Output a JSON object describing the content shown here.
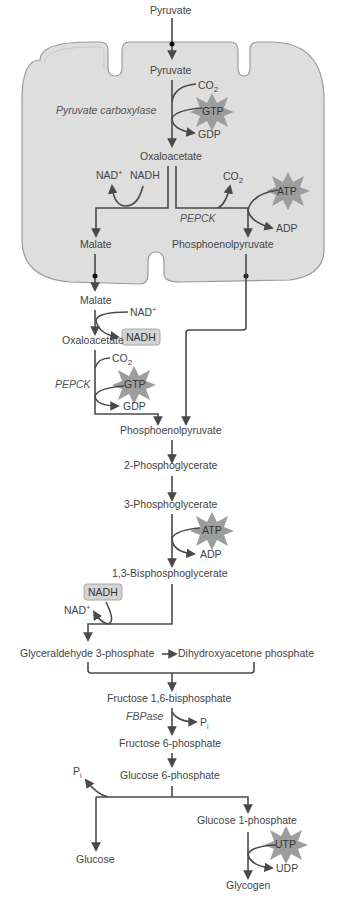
{
  "diagram": {
    "colors": {
      "mitochondrion_fill": "#dedede",
      "membrane_stroke": "#9a9a9a",
      "arrow": "#4a4a4a",
      "starburst": "#9d9d9d",
      "nadh_box": "#d4d4d4",
      "text": "#444444"
    },
    "mitochondrion": {
      "pyruvate_outside": "Pyruvate",
      "pyruvate_inside": "Pyruvate",
      "co2_1": "CO",
      "co2_1_sub": "2",
      "gtp_1": "GTP",
      "gdp_1": "GDP",
      "enzyme_pc": "Pyruvate carboxylase",
      "oxaloacetate": "Oxaloacetate",
      "nad_plus": "NAD",
      "nad_plus_sup": "+",
      "nadh": "NADH",
      "co2_2": "CO",
      "co2_2_sub": "2",
      "atp_1": "ATP",
      "adp_1": "ADP",
      "enzyme_pepck": "PEPCK",
      "malate": "Malate",
      "pep": "Phosphoenolpyruvate"
    },
    "cytosol": {
      "malate": "Malate",
      "nad_plus": "NAD",
      "nad_plus_sup": "+",
      "nadh_box": "NADH",
      "oxaloacetate": "Oxaloacetate",
      "co2": "CO",
      "co2_sub": "2",
      "enzyme_pepck": "PEPCK",
      "gtp": "GTP",
      "gdp": "GDP",
      "pep": "Phosphoenolpyruvate",
      "pg2": "2-Phosphoglycerate",
      "pg3": "3-Phosphoglycerate",
      "atp": "ATP",
      "adp": "ADP",
      "bpg": "1,3-Bisphosphoglycerate",
      "nadh_box2": "NADH",
      "nad_plus2": "NAD",
      "nad_plus2_sup": "+",
      "g3p": "Glyceraldehyde 3-phosphate",
      "dhap": "Dihydroxyacetone phosphate",
      "f16bp": "Fructose 1,6-bisphosphate",
      "enzyme_fbpase": "FBPase",
      "pi_1": "P",
      "pi_1_sub": "i",
      "f6p": "Fructose 6-phosphate",
      "g6p": "Glucose 6-phosphate",
      "pi_2": "P",
      "pi_2_sub": "i",
      "glucose": "Glucose",
      "g1p": "Glucose 1-phosphate",
      "utp": "UTP",
      "udp": "UDP",
      "glycogen": "Glycogen"
    }
  }
}
